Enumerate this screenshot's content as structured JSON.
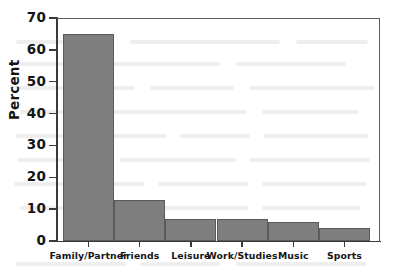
{
  "chart_data": {
    "type": "bar",
    "title": "",
    "xlabel": "",
    "ylabel": "Percent",
    "categories": [
      "Family/Partner",
      "Friends",
      "Leisure",
      "Work/Studies",
      "Music",
      "Sports"
    ],
    "values": [
      65,
      13,
      7,
      7,
      6,
      4
    ],
    "ylim": [
      0,
      70
    ],
    "yticks": [
      0,
      10,
      20,
      30,
      40,
      50,
      60,
      70
    ],
    "ytick_labels": [
      "0",
      "10",
      "20",
      "30",
      "40",
      "50",
      "60",
      "70"
    ],
    "grid": false,
    "legend": null,
    "legend_position": "none",
    "bar_color": "#7e7e7e",
    "bar_edge_color": "#5a5a5a",
    "axis_color": "#3a3a3a",
    "background_color": "#ffffff",
    "annotations": []
  },
  "figure": {
    "y_axis_title": "Percent"
  }
}
